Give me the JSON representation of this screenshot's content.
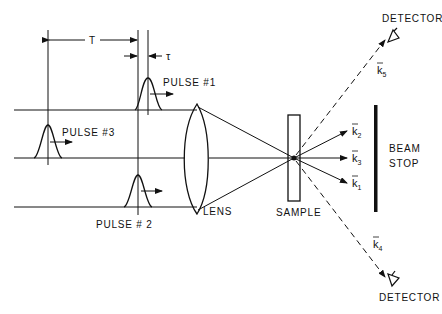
{
  "diagram": {
    "labels": {
      "pulse1": "PULSE #1",
      "pulse2": "PULSE # 2",
      "pulse3": "PULSE #3",
      "lens": "LENS",
      "sample": "SAMPLE",
      "beam_stop_line1": "BEAM",
      "beam_stop_line2": "STOP",
      "detector_top": "DETECTOR",
      "detector_bottom": "DETECTOR",
      "delay_T": "T",
      "delay_tau": "τ"
    },
    "wavevectors": {
      "k1": {
        "base": "k",
        "sub": "1"
      },
      "k2": {
        "base": "k",
        "sub": "2"
      },
      "k3": {
        "base": "k",
        "sub": "3"
      },
      "k4": {
        "base": "k",
        "sub": "4"
      },
      "k5": {
        "base": "k",
        "sub": "5"
      }
    },
    "colors": {
      "ink": "#111111",
      "background": "#ffffff"
    }
  }
}
